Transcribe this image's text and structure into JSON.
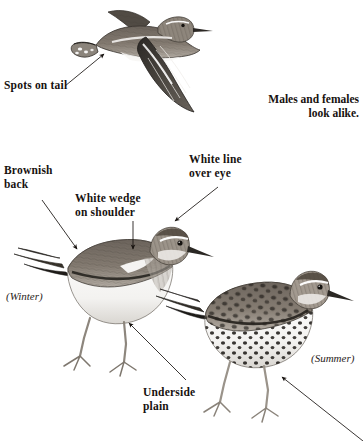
{
  "page": {
    "kind": "field-guide-illustration-plate",
    "background_color": "#ffffff",
    "ink_color": "#17120f"
  },
  "labels": {
    "spots_on_tail": "Spots on tail",
    "brownish_back": "Brownish\nback",
    "white_wedge_on_shoulder": "White wedge\non shoulder",
    "white_line_over_eye": "White line\nover eye",
    "underside_plain": "Underside\nplain"
  },
  "notes": {
    "males_females": "Males and females\nlook alike."
  },
  "season_tags": {
    "winter": "(Winter)",
    "summer": "(Summer)"
  },
  "figures": [
    {
      "id": "flying-bird",
      "name": "sandpiper-in-flight",
      "pose": "flying, wings spread, viewed from above-side",
      "callouts": [
        "spots_on_tail"
      ]
    },
    {
      "id": "winter-bird",
      "name": "sandpiper-winter-plumage",
      "pose": "standing, facing right",
      "season_tag": "(Winter)",
      "callouts": [
        "brownish_back",
        "white_wedge_on_shoulder",
        "white_line_over_eye",
        "underside_plain"
      ]
    },
    {
      "id": "summer-bird",
      "name": "sandpiper-summer-plumage",
      "pose": "standing, facing right, spotted breast",
      "season_tag": "(Summer)",
      "callouts": []
    }
  ],
  "arrows": [
    {
      "name": "arrow-spots-on-tail",
      "from": [
        65,
        86
      ],
      "to": [
        106,
        52
      ]
    },
    {
      "name": "arrow-brownish-back",
      "from": [
        42,
        200
      ],
      "to": [
        79,
        251
      ]
    },
    {
      "name": "arrow-white-wedge",
      "from": [
        133,
        221
      ],
      "to": [
        133,
        251
      ]
    },
    {
      "name": "arrow-white-line-over-eye",
      "from": [
        218,
        187
      ],
      "to": [
        173,
        223
      ]
    },
    {
      "name": "arrow-underside-plain",
      "from": [
        186,
        380
      ],
      "to": [
        128,
        322
      ]
    },
    {
      "name": "arrow-summer-underparts",
      "from": [
        363,
        441
      ],
      "to": [
        280,
        376
      ]
    }
  ]
}
